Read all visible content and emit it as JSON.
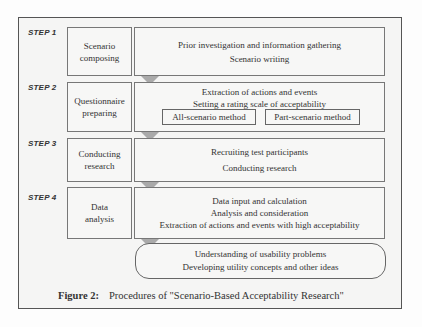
{
  "steps": [
    {
      "label": "STEP 1",
      "phase": [
        "Scenario",
        "composing"
      ],
      "activities": [
        "Prior investigation and information gathering",
        "Scenario writing"
      ]
    },
    {
      "label": "STEP 2",
      "phase": [
        "Questionnaire",
        "preparing"
      ],
      "activities": [
        "Extraction of actions and events",
        "Setting a rating scale of acceptability"
      ],
      "methods": [
        "All-scenario method",
        "Part-scenario method"
      ]
    },
    {
      "label": "STEP 3",
      "phase": [
        "Conducting",
        "research"
      ],
      "activities": [
        "Recruiting test participants",
        "Conducting research"
      ]
    },
    {
      "label": "STEP 4",
      "phase": [
        "Data",
        "analysis"
      ],
      "activities": [
        "Data input and calculation",
        "Analysis and consideration",
        "Extraction of actions and events with high acceptability"
      ]
    }
  ],
  "outcome": [
    "Understanding of usability problems",
    "Developing utility concepts and other ideas"
  ],
  "caption": {
    "label": "Figure 2:",
    "text": "Procedures of \"Scenario-Based Acceptability Research\""
  }
}
